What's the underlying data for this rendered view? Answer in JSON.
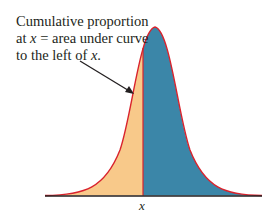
{
  "annotation": {
    "line1": "Cumulative proportion",
    "line2_pre": "at ",
    "line2_var": "x",
    "line2_post": " = area under curve",
    "line3_pre": "to the left of ",
    "line3_var": "x",
    "line3_post": "."
  },
  "axis": {
    "x_label": "x"
  },
  "colors": {
    "left_area": "#f8c98a",
    "right_area": "#3b86a8",
    "curve": "#d9232d",
    "baseline": "#231f20",
    "arrow": "#231f20"
  }
}
